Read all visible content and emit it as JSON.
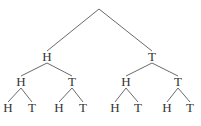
{
  "diagram": {
    "type": "tree",
    "root": {
      "x": 99,
      "y": 9
    },
    "nodes": [
      {
        "id": "n1",
        "label": "H",
        "x": 47,
        "y": 57,
        "parent": "root"
      },
      {
        "id": "n2",
        "label": "T",
        "x": 152,
        "y": 57,
        "parent": "root"
      },
      {
        "id": "n3",
        "label": "H",
        "x": 21,
        "y": 82,
        "parent": "n1"
      },
      {
        "id": "n4",
        "label": "T",
        "x": 72,
        "y": 82,
        "parent": "n1"
      },
      {
        "id": "n5",
        "label": "H",
        "x": 126,
        "y": 82,
        "parent": "n2"
      },
      {
        "id": "n6",
        "label": "T",
        "x": 178,
        "y": 82,
        "parent": "n2"
      },
      {
        "id": "n7",
        "label": "H",
        "x": 8,
        "y": 108,
        "parent": "n3"
      },
      {
        "id": "n8",
        "label": "T",
        "x": 32,
        "y": 108,
        "parent": "n3"
      },
      {
        "id": "n9",
        "label": "H",
        "x": 59,
        "y": 108,
        "parent": "n4"
      },
      {
        "id": "n10",
        "label": "T",
        "x": 83,
        "y": 108,
        "parent": "n4"
      },
      {
        "id": "n11",
        "label": "H",
        "x": 115,
        "y": 108,
        "parent": "n5"
      },
      {
        "id": "n12",
        "label": "T",
        "x": 138,
        "y": 108,
        "parent": "n5"
      },
      {
        "id": "n13",
        "label": "H",
        "x": 167,
        "y": 108,
        "parent": "n6"
      },
      {
        "id": "n14",
        "label": "T",
        "x": 190,
        "y": 108,
        "parent": "n6"
      }
    ]
  }
}
